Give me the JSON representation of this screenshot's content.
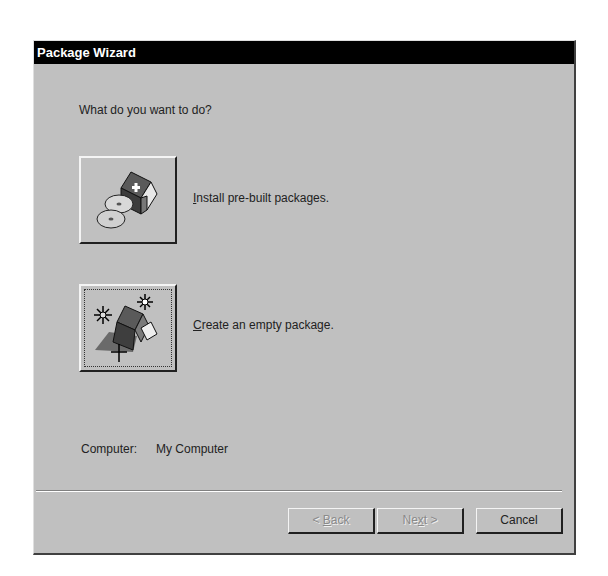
{
  "window": {
    "title": "Package Wizard"
  },
  "main": {
    "prompt": "What do you want to do?",
    "options": [
      {
        "icon": "install-package-icon",
        "mnemonic": "I",
        "label_rest": "nstall pre-built packages."
      },
      {
        "icon": "create-package-icon",
        "mnemonic": "C",
        "label_rest": "reate an empty package."
      }
    ],
    "computer_label": "Computer:",
    "computer_value": "My Computer"
  },
  "footer": {
    "back": {
      "prefix": "< ",
      "mnemonic": "B",
      "rest": "ack",
      "enabled": false
    },
    "next": {
      "prefix": "Ne",
      "mnemonic": "x",
      "rest": "t >",
      "enabled": false
    },
    "cancel": {
      "label": "Cancel",
      "enabled": true
    }
  }
}
